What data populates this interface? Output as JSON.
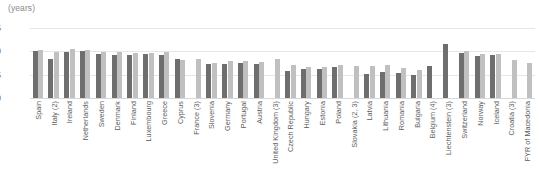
{
  "axis": {
    "unit_label": "(years)",
    "tick_labels": [
      "35",
      "30",
      "25",
      "20"
    ]
  },
  "colors": {
    "series_a": "#6e6e6e",
    "series_b": "#c0c0c0",
    "gridline": "#e6e6e6",
    "text": "#5a5a5a"
  },
  "chart_data": {
    "type": "bar",
    "title": "",
    "subtitle": "",
    "xlabel": "",
    "ylabel": "(years)",
    "ylim": [
      20,
      35
    ],
    "yticks": [
      20,
      25,
      30,
      35
    ],
    "grid": true,
    "legend_position": "none",
    "categories": [
      "Spain",
      "Italy (2)",
      "Ireland",
      "Netherlands",
      "Sweden",
      "Denmark",
      "Finland",
      "Luxembourg",
      "Greece",
      "Cyprus",
      "France (3)",
      "Slovenia",
      "Germany",
      "Portugal",
      "Austria",
      "United Kingdom (3)",
      "Czech Republic",
      "Hungary",
      "Estonia",
      "Poland",
      "Slovakia (2, 3)",
      "Latvia",
      "Lithuania",
      "Romania",
      "Bulgaria",
      "Belgium (4)",
      "Liechtenstein (3)",
      "Switzerland",
      "Norway",
      "Iceland",
      "Croatia (3)",
      "FYR of Macedonia"
    ],
    "series": [
      {
        "name": "Series A",
        "values": [
          30.0,
          28.4,
          29.9,
          30.0,
          29.4,
          29.3,
          29.3,
          29.4,
          29.3,
          28.3,
          null,
          27.2,
          27.3,
          27.4,
          27.3,
          null,
          25.7,
          26.3,
          26.2,
          26.6,
          null,
          25.2,
          25.6,
          25.4,
          24.9,
          26.8,
          31.6,
          29.7,
          29.1,
          29.2,
          null,
          null
        ]
      },
      {
        "name": "Series B",
        "values": [
          30.3,
          29.9,
          30.4,
          30.2,
          29.8,
          29.8,
          29.7,
          29.7,
          29.9,
          28.2,
          28.3,
          27.4,
          28.0,
          27.9,
          27.8,
          28.4,
          27.1,
          26.7,
          26.6,
          27.0,
          26.8,
          26.9,
          27.0,
          26.4,
          25.9,
          null,
          null,
          30.1,
          29.5,
          29.4,
          28.1,
          27.6
        ]
      }
    ]
  }
}
